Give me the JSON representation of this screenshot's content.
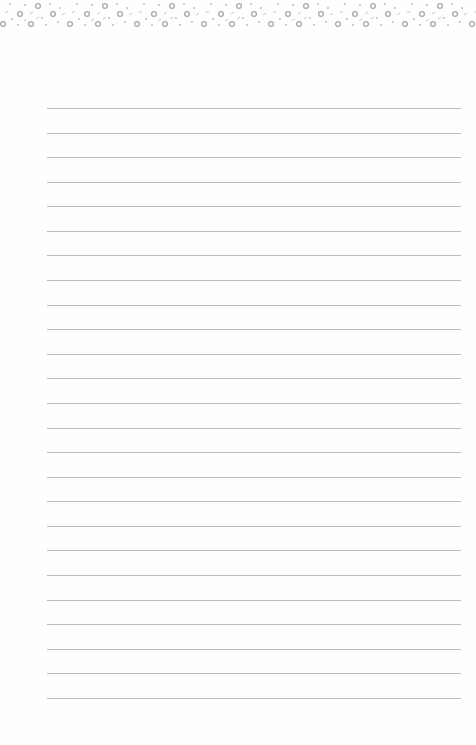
{
  "document": {
    "type": "lined-notepaper",
    "line_count": 25,
    "first_line_y": 108,
    "line_spacing": 24.58,
    "line_left": 47,
    "line_width": 414,
    "line_color": "#bcbcbc",
    "background_color": "#fefefe",
    "border_pattern": "decorative-rings-and-dots",
    "border_color": "#b0b0b0"
  }
}
